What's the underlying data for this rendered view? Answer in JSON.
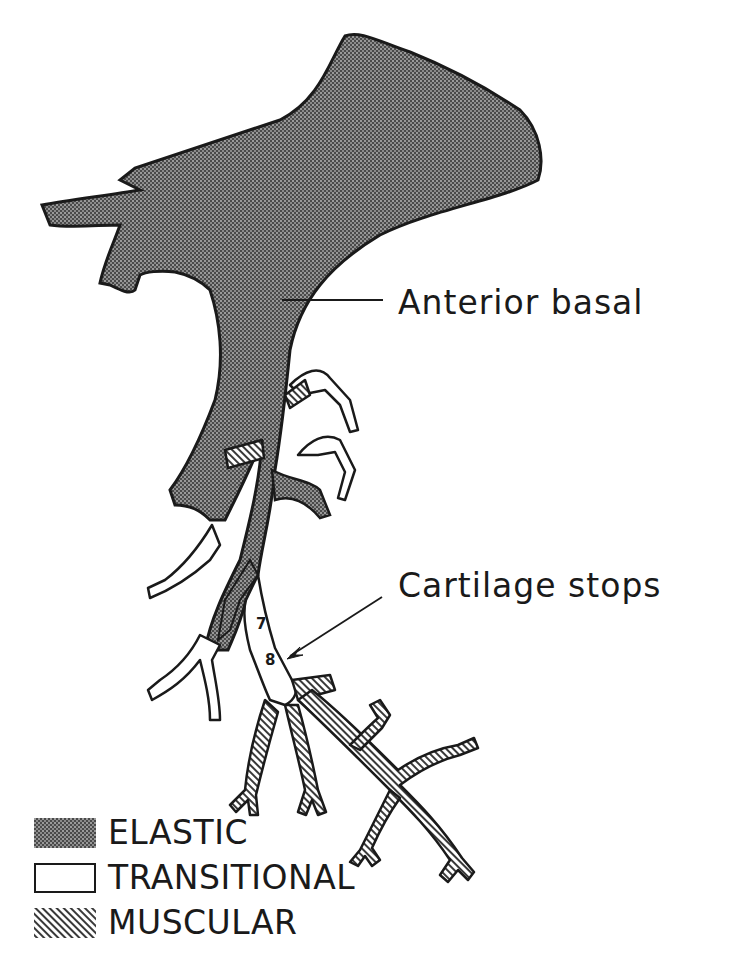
{
  "figure": {
    "type": "anatomical-diagram"
  },
  "callouts": {
    "anterior_basal": "Anterior basal",
    "cartilage_stops": "Cartilage stops"
  },
  "generation_markers": {
    "seven": "7",
    "eight": "8"
  },
  "legend": {
    "items": [
      {
        "label": "ELASTIC",
        "pattern": "crosshatch",
        "fill": "#555555"
      },
      {
        "label": "TRANSITIONAL",
        "pattern": "blank",
        "fill": "#ffffff"
      },
      {
        "label": "MUSCULAR",
        "pattern": "diagonal-lines",
        "fill": "#888888"
      }
    ]
  },
  "colors": {
    "ink": "#1a1a1a",
    "background": "#ffffff"
  }
}
